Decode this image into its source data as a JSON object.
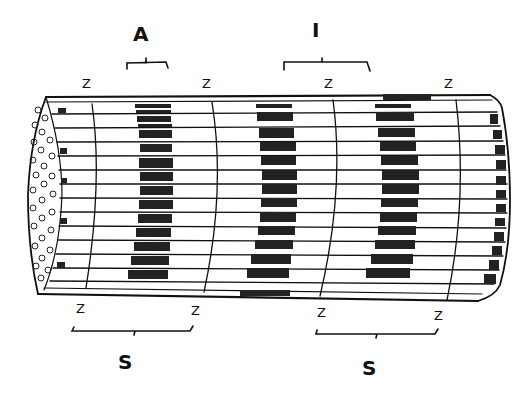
{
  "diagram": {
    "labels": {
      "A_band": "A",
      "I_band": "I",
      "sarcomere_left": "S",
      "sarcomere_right": "S",
      "z_top_1": "Z",
      "z_top_2": "Z",
      "z_top_3": "Z",
      "z_top_4": "Z",
      "z_bottom_1": "Z",
      "z_bottom_2": "Z",
      "z_bottom_3": "Z",
      "z_bottom_4": "Z"
    },
    "colors": {
      "ink": "#111111",
      "background": "#ffffff"
    }
  }
}
